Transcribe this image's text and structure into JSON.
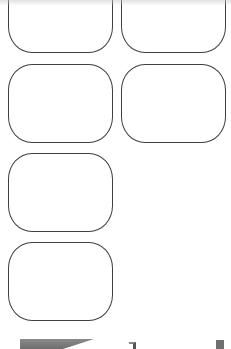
{
  "screen": {
    "width": 231,
    "height": 349,
    "background": "#ffffff"
  },
  "grid": {
    "columns": 2,
    "border_color": "#3f3f3f",
    "tiles": [
      {
        "label": "",
        "left": 8,
        "top": -26,
        "width": 105,
        "height": 79
      },
      {
        "label": "",
        "left": 121,
        "top": -26,
        "width": 105,
        "height": 79
      },
      {
        "label": "",
        "left": 8,
        "top": 64,
        "width": 105,
        "height": 79
      },
      {
        "label": "",
        "left": 121,
        "top": 64,
        "width": 105,
        "height": 79
      },
      {
        "label": "",
        "left": 8,
        "top": 153,
        "width": 105,
        "height": 79
      },
      {
        "label": "",
        "left": 8,
        "top": 242,
        "width": 105,
        "height": 79
      }
    ]
  },
  "bottom_bar": {
    "partially_visible": true,
    "items": [
      {
        "icon": "banner-shape"
      },
      {
        "icon": "corner-bracket-icon"
      },
      {
        "icon": "square-icon"
      }
    ]
  }
}
